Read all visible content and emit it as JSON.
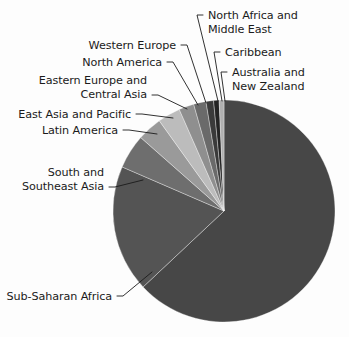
{
  "figure": {
    "background_color": "#fdfdfd",
    "text_color": "#1b1b1b",
    "leader_color": "#1b1b1b"
  },
  "chart_data": {
    "type": "pie",
    "title": "",
    "subtitle": "",
    "xlabel": "",
    "ylabel": "",
    "grid": false,
    "legend_position": "none",
    "label_style": "leader-lines-outside",
    "start_angle_deg": 90,
    "direction": "clockwise",
    "center": {
      "x": 224,
      "y": 211
    },
    "radius": 111,
    "categories": [
      "Sub-Saharan Africa",
      "South and Southeast Asia",
      "Latin America",
      "East Asia and Pacific",
      "Eastern Europe and Central Asia",
      "North America",
      "Western Europe",
      "North Africa and Middle East",
      "Caribbean",
      "Australia and New Zealand"
    ],
    "values": [
      63.0,
      18.5,
      5.0,
      3.6,
      3.3,
      2.2,
      1.8,
      1.1,
      0.8,
      0.7
    ],
    "units": "percent",
    "colors": [
      "#474747",
      "#545454",
      "#6e6e6e",
      "#9a9a9a",
      "#bcbcbc",
      "#8f8f8f",
      "#6a6a6a",
      "#3a3a3a",
      "#242424",
      "#b0b0b0"
    ],
    "annotations": [
      {
        "label": "North Africa and Middle East",
        "lines": [
          "North Africa and",
          "Middle East"
        ],
        "text_x": 208,
        "text_y": 19,
        "anchor": "start",
        "elbow_x": 197,
        "elbow_y": 15,
        "tick_x": 203,
        "tick_y": 15,
        "point_x": 218,
        "point_y": 101
      },
      {
        "label": "Caribbean",
        "lines": [
          "Caribbean"
        ],
        "text_x": 225,
        "text_y": 56,
        "anchor": "start",
        "elbow_x": 214,
        "elbow_y": 52,
        "tick_x": 220,
        "tick_y": 52,
        "point_x": 222,
        "point_y": 101
      },
      {
        "label": "Australia and New Zealand",
        "lines": [
          "Australia and",
          "New Zealand"
        ],
        "text_x": 232,
        "text_y": 76,
        "anchor": "start",
        "elbow_x": 221,
        "elbow_y": 72,
        "tick_x": 227,
        "tick_y": 72,
        "point_x": 225,
        "point_y": 101
      },
      {
        "label": "Western Europe",
        "lines": [
          "Western Europe"
        ],
        "text_x": 176,
        "text_y": 49,
        "anchor": "end",
        "elbow_x": 187,
        "elbow_y": 45,
        "tick_x": 181,
        "tick_y": 45,
        "point_x": 206,
        "point_y": 103
      },
      {
        "label": "North America",
        "lines": [
          "North America"
        ],
        "text_x": 162,
        "text_y": 66,
        "anchor": "end",
        "elbow_x": 173,
        "elbow_y": 62,
        "tick_x": 167,
        "tick_y": 62,
        "point_x": 198,
        "point_y": 105
      },
      {
        "label": "Eastern Europe and Central Asia",
        "lines": [
          "Eastern Europe and",
          "Central Asia"
        ],
        "text_x": 147,
        "text_y": 84,
        "anchor": "end",
        "elbow_x": 158,
        "elbow_y": 95,
        "tick_x": 152,
        "tick_y": 95,
        "point_x": 187,
        "point_y": 109
      },
      {
        "label": "East Asia and Pacific",
        "lines": [
          "East Asia and Pacific"
        ],
        "text_x": 131,
        "text_y": 118,
        "anchor": "end",
        "elbow_x": 142,
        "elbow_y": 114,
        "tick_x": 136,
        "tick_y": 114,
        "point_x": 173,
        "point_y": 118
      },
      {
        "label": "Latin America",
        "lines": [
          "Latin America"
        ],
        "text_x": 118,
        "text_y": 134,
        "anchor": "end",
        "elbow_x": 129,
        "elbow_y": 130,
        "tick_x": 123,
        "tick_y": 130,
        "point_x": 157,
        "point_y": 134
      },
      {
        "label": "South and Southeast Asia",
        "lines": [
          "South and",
          "Southeast Asia"
        ],
        "text_x": 104,
        "text_y": 176,
        "anchor": "end",
        "elbow_x": 115,
        "elbow_y": 187,
        "tick_x": 109,
        "tick_y": 187,
        "point_x": 143,
        "point_y": 180
      },
      {
        "label": "Sub-Saharan Africa",
        "lines": [
          "Sub-Saharan Africa"
        ],
        "text_x": 112,
        "text_y": 300,
        "anchor": "end",
        "elbow_x": 123,
        "elbow_y": 296,
        "tick_x": 117,
        "tick_y": 296,
        "point_x": 152,
        "point_y": 272
      }
    ]
  }
}
